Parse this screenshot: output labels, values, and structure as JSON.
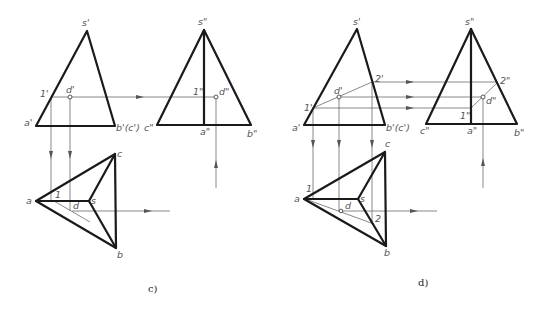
{
  "figure": {
    "colors": {
      "object_line": "#1a1a1a",
      "construction_line": "#6a6a6a",
      "label": "#555555"
    }
  },
  "panels": [
    {
      "caption": "c)",
      "front_view": {
        "labels": {
          "apex": "s'",
          "left_base": "a'",
          "right_base": "b'(c')",
          "point1": "1'",
          "pointD": "d'"
        }
      },
      "side_view": {
        "labels": {
          "apex": "s\"",
          "left_base": "c\"",
          "mid_base": "a\"",
          "right_base": "b\"",
          "point1": "1\"",
          "pointD": "d\""
        }
      },
      "top_view": {
        "labels": {
          "a": "a",
          "b": "b",
          "c": "c",
          "s": "s",
          "point1": "1",
          "pointD": "d"
        }
      }
    },
    {
      "caption": "d)",
      "front_view": {
        "labels": {
          "apex": "s'",
          "left_base": "a'",
          "right_base": "b'(c')",
          "point1": "1'",
          "pointD": "d'",
          "point2": "2'"
        }
      },
      "side_view": {
        "labels": {
          "apex": "s\"",
          "left_base": "c\"",
          "mid_base": "a\"",
          "right_base": "b\"",
          "point1": "1\"",
          "pointD": "d\"",
          "point2": "2\""
        }
      },
      "top_view": {
        "labels": {
          "a": "a",
          "b": "b",
          "c": "c",
          "s": "s",
          "point1": "1",
          "pointD": "d",
          "point2": "2"
        }
      }
    }
  ]
}
